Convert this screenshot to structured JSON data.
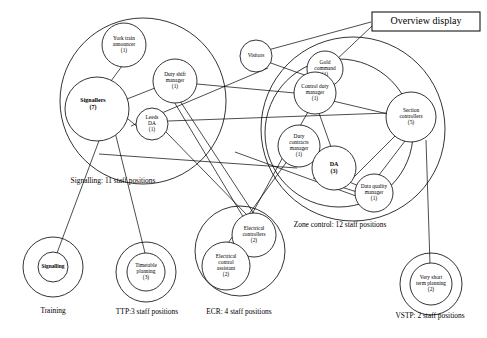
{
  "diagram": {
    "title": "Overview display",
    "boxes": [
      {
        "name": "overview-display",
        "label": "Overview display",
        "x": 372,
        "y": 12,
        "w": 108,
        "h": 19
      }
    ],
    "group_circles": [
      {
        "name": "signalling-group",
        "cx": 143,
        "cy": 101,
        "r": 83
      },
      {
        "name": "zone-control-group",
        "cx": 353,
        "cy": 129,
        "r": 92
      },
      {
        "name": "zone-control-inner",
        "cx": 339,
        "cy": 133,
        "r": 74
      },
      {
        "name": "training-outer",
        "cx": 53,
        "cy": 267,
        "r": 30
      },
      {
        "name": "ttp-outer",
        "cx": 146,
        "cy": 272,
        "r": 30
      },
      {
        "name": "ecr-outer",
        "cx": 240,
        "cy": 251,
        "r": 45
      },
      {
        "name": "vstp-outer",
        "cx": 431,
        "cy": 284,
        "r": 31
      }
    ],
    "group_labels": [
      {
        "name": "signalling-caption",
        "text": "Signalling: 11 staff positions",
        "x": 113,
        "y": 181
      },
      {
        "name": "zone-control-caption",
        "text": "Zone control: 12 staff positions",
        "x": 340,
        "y": 225
      },
      {
        "name": "training-caption",
        "text": "Training",
        "x": 53,
        "y": 311
      },
      {
        "name": "ttp-caption",
        "text": "TTP:3 staff positions",
        "x": 147,
        "y": 312
      },
      {
        "name": "ecr-caption",
        "text": "ECR: 4 staff positions",
        "x": 239,
        "y": 312
      },
      {
        "name": "vstp-caption",
        "text": "VSTP: 2 staff positions",
        "x": 430,
        "y": 316
      }
    ],
    "nodes": [
      {
        "name": "york-train-announcer",
        "lines": [
          "York train",
          "announcer",
          "(1)"
        ],
        "cx": 124,
        "cy": 45,
        "r": 22
      },
      {
        "name": "signallers",
        "lines": [
          "Signallers",
          "(7)"
        ],
        "cx": 97,
        "cy": 109,
        "r": 32,
        "label_dx": -4,
        "label_dy": -5,
        "big": true
      },
      {
        "name": "duty-shift-manager",
        "lines": [
          "Duty shift",
          "manager",
          "(1)"
        ],
        "cx": 175,
        "cy": 81,
        "r": 22
      },
      {
        "name": "leeds-da",
        "lines": [
          "Leeds",
          "DA",
          "(1)"
        ],
        "cx": 152,
        "cy": 124,
        "r": 16
      },
      {
        "name": "visitors",
        "lines": [
          "Visitors"
        ],
        "cx": 256,
        "cy": 56,
        "r": 16
      },
      {
        "name": "gold-command",
        "lines": [
          "Gold",
          "command",
          "(1)"
        ],
        "cx": 325,
        "cy": 69,
        "r": 18
      },
      {
        "name": "control-duty-manager",
        "lines": [
          "Control duty",
          "manager",
          "(1)"
        ],
        "cx": 315,
        "cy": 93,
        "r": 21
      },
      {
        "name": "section-controllers",
        "lines": [
          "Section",
          "controllers",
          "(5)"
        ],
        "cx": 411,
        "cy": 117,
        "r": 25
      },
      {
        "name": "duty-contracts-manager",
        "lines": [
          "Duty",
          "contracts",
          "manager",
          "(1)"
        ],
        "cx": 299,
        "cy": 146,
        "r": 21
      },
      {
        "name": "da",
        "lines": [
          "DA",
          "(3)"
        ],
        "cx": 334,
        "cy": 168,
        "r": 22,
        "big": true
      },
      {
        "name": "data-quality-manager",
        "lines": [
          "Data quality",
          "manager",
          "(1)"
        ],
        "cx": 374,
        "cy": 193,
        "r": 19
      },
      {
        "name": "signalling-training",
        "lines": [
          "Signalling"
        ],
        "cx": 53,
        "cy": 267,
        "r": 15
      },
      {
        "name": "timetable-planning",
        "lines": [
          "Timetable",
          "planning",
          "(3)"
        ],
        "cx": 146,
        "cy": 272,
        "r": 19
      },
      {
        "name": "electrical-controllers",
        "lines": [
          "Electrical",
          "controllers",
          "(2)"
        ],
        "cx": 254,
        "cy": 235,
        "r": 22
      },
      {
        "name": "electrical-control-assistant",
        "lines": [
          "Electrical",
          "control",
          "assistant",
          "(2)"
        ],
        "cx": 226,
        "cy": 266,
        "r": 24
      },
      {
        "name": "very-short-term-planning",
        "lines": [
          "Very short",
          "term planning",
          "(2)"
        ],
        "cx": 431,
        "cy": 284,
        "r": 21
      }
    ],
    "links": [
      {
        "name": "link-signallers-york",
        "x1": 81,
        "y1": 122,
        "x2": 122,
        "y2": 66
      },
      {
        "name": "link-signallers-duty-shift",
        "x1": 122,
        "y1": 101,
        "x2": 155,
        "y2": 88
      },
      {
        "name": "link-signallers-leeds",
        "x1": 122,
        "y1": 114,
        "x2": 139,
        "y2": 128
      },
      {
        "name": "link-signallers-training",
        "x1": 106,
        "y1": 122,
        "x2": 54,
        "y2": 261
      },
      {
        "name": "link-signallers-ttp",
        "x1": 112,
        "y1": 120,
        "x2": 146,
        "y2": 257
      },
      {
        "name": "link-duty-shift-control-duty",
        "x1": 197,
        "y1": 84,
        "x2": 295,
        "y2": 93
      },
      {
        "name": "link-duty-shift-ecr",
        "x1": 180,
        "y1": 101,
        "x2": 256,
        "y2": 217
      },
      {
        "name": "link-leeds-section",
        "x1": 168,
        "y1": 121,
        "x2": 388,
        "y2": 113
      },
      {
        "name": "link-leeds-ecr",
        "x1": 166,
        "y1": 132,
        "x2": 248,
        "y2": 216
      },
      {
        "name": "link-visitors-overview",
        "x1": 268,
        "y1": 50,
        "x2": 371,
        "y2": 22
      },
      {
        "name": "link-visitors-control-duty",
        "x1": 268,
        "y1": 62,
        "x2": 310,
        "y2": 77
      },
      {
        "name": "link-gold-overview",
        "x1": 334,
        "y1": 62,
        "x2": 372,
        "y2": 26
      },
      {
        "name": "link-gold-control-duty",
        "x1": 320,
        "y1": 86,
        "x2": 318,
        "y2": 76
      },
      {
        "name": "link-control-duty-section",
        "x1": 333,
        "y1": 101,
        "x2": 388,
        "y2": 114
      },
      {
        "name": "link-control-duty-contracts",
        "x1": 308,
        "y1": 112,
        "x2": 300,
        "y2": 126
      },
      {
        "name": "link-control-duty-da",
        "x1": 319,
        "y1": 113,
        "x2": 331,
        "y2": 147
      },
      {
        "name": "link-section-da",
        "x1": 397,
        "y1": 134,
        "x2": 348,
        "y2": 183
      },
      {
        "name": "link-section-dataquality",
        "x1": 405,
        "y1": 141,
        "x2": 379,
        "y2": 175
      },
      {
        "name": "link-da-dataquality",
        "x1": 347,
        "y1": 181,
        "x2": 361,
        "y2": 187
      },
      {
        "name": "link-da-dataquality-2",
        "x1": 313,
        "y1": 178,
        "x2": 357,
        "y2": 192
      },
      {
        "name": "link-contracts-ecr",
        "x1": 288,
        "y1": 160,
        "x2": 228,
        "y2": 243
      },
      {
        "name": "link-contracts-ecr-2",
        "x1": 284,
        "y1": 155,
        "x2": 252,
        "y2": 214
      },
      {
        "name": "link-section-vstp",
        "x1": 426,
        "y1": 140,
        "x2": 430,
        "y2": 264
      },
      {
        "name": "link-dataquality-left",
        "x1": 356,
        "y1": 196,
        "x2": 235,
        "y2": 152
      },
      {
        "name": "link-crosslong-1",
        "x1": 131,
        "y1": 126,
        "x2": 268,
        "y2": 68
      },
      {
        "name": "link-crosslong-2",
        "x1": 161,
        "y1": 80,
        "x2": 245,
        "y2": 220
      },
      {
        "name": "link-crosslong-3",
        "x1": 99,
        "y1": 154,
        "x2": 297,
        "y2": 168
      }
    ]
  }
}
